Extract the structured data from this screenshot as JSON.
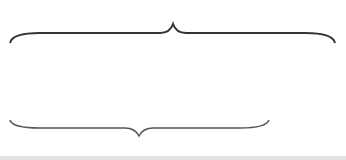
{
  "diagram": {
    "top_label": {
      "var": "M",
      "suffix": "개"
    },
    "bottom_label": {
      "var": "m",
      "suffix": "개"
    },
    "ellipsis": "·····",
    "top_row": [
      {
        "name": "N",
        "sub": "1",
        "color": "#5a5a5a",
        "x": 10
      },
      {
        "name": "N",
        "sub": "2",
        "color": "#636363",
        "x": 55
      },
      {
        "name": "N",
        "sub": "3",
        "color": "#6b6b6b",
        "x": 100
      },
      {
        "name": "N",
        "sub": "4",
        "color": "#727272",
        "x": 146
      },
      {
        "name": "N",
        "sub": "5",
        "color": "#7c7c7c",
        "x": 193
      },
      {
        "name": "N",
        "sub": "6",
        "color": "#838383",
        "x": 238
      },
      {
        "name": "N",
        "sub": "M",
        "color": "#8c8c8c",
        "x": 303
      }
    ],
    "bottom_row": [
      {
        "name": "N",
        "sub": "1",
        "color": "#5a5a5a",
        "x": 10
      },
      {
        "name": "N",
        "sub": "2",
        "color": "#6b6b6b",
        "x": 100
      },
      {
        "name": "N",
        "sub": "M",
        "color": "#838383",
        "x": 238
      }
    ]
  }
}
